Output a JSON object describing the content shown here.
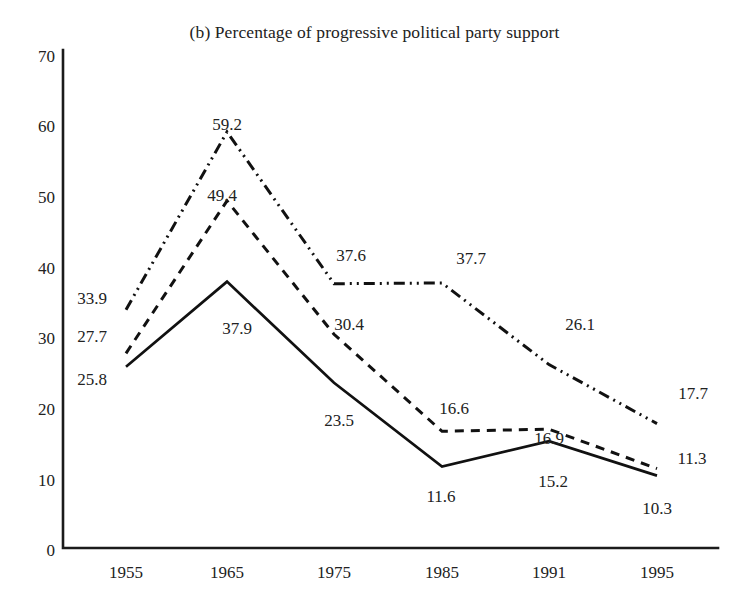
{
  "chart_data": {
    "type": "line",
    "title": "(b) Percentage of progressive political party support",
    "xlabel": "",
    "ylabel": "",
    "categories": [
      "1955",
      "1965",
      "1975",
      "1985",
      "1991",
      "1995"
    ],
    "x": [
      1955,
      1965,
      1975,
      1985,
      1991,
      1995
    ],
    "ylim": [
      0,
      70
    ],
    "yticks": [
      0,
      10,
      20,
      30,
      40,
      50,
      60,
      70
    ],
    "grid": false,
    "legend": "none",
    "series": [
      {
        "name": "series-dash-dot",
        "style": "dash-dot-dot",
        "color": "#111111",
        "values": [
          33.9,
          59.2,
          37.6,
          37.7,
          26.1,
          17.7
        ],
        "labels": [
          "33.9",
          "59.2",
          "37.6",
          "37.7",
          "26.1",
          "17.7"
        ]
      },
      {
        "name": "series-dashed",
        "style": "dashed",
        "color": "#111111",
        "values": [
          27.7,
          49.4,
          30.4,
          16.6,
          16.9,
          11.3
        ],
        "labels": [
          "27.7",
          "49.4",
          "30.4",
          "16.6",
          "16.9",
          "11.3"
        ]
      },
      {
        "name": "series-solid",
        "style": "solid",
        "color": "#111111",
        "values": [
          25.8,
          37.9,
          23.5,
          11.6,
          15.2,
          10.3
        ],
        "labels": [
          "25.8",
          "37.9",
          "23.5",
          "11.6",
          "15.2",
          "10.3"
        ]
      }
    ]
  },
  "axis": {
    "y_tick_labels": [
      "70",
      "60",
      "50",
      "40",
      "30",
      "20",
      "10",
      "0"
    ],
    "x_tick_labels": [
      "1955",
      "1965",
      "1975",
      "1985",
      "1991",
      "1995"
    ]
  },
  "labels": {
    "dashdot": [
      "33.9",
      "59.2",
      "37.6",
      "37.7",
      "26.1",
      "17.7"
    ],
    "dashed": [
      "27.7",
      "49.4",
      "30.4",
      "16.6",
      "16.9",
      "11.3"
    ],
    "solid": [
      "25.8",
      "37.9",
      "23.5",
      "11.6",
      "15.2",
      "10.3"
    ]
  }
}
